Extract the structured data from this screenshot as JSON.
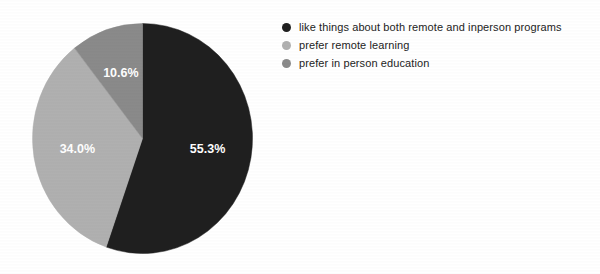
{
  "background_color": "#ffffff",
  "chart_data": {
    "type": "pie",
    "title": "",
    "subtitle": "",
    "xlabel": "",
    "ylabel": "",
    "grid": false,
    "legend_position": "right",
    "start_angle_deg": 0,
    "direction": "clockwise",
    "labels": [
      "like things about both remote and inperson programs",
      "prefer remote learning",
      "prefer in person education"
    ],
    "values": [
      55.3,
      34.0,
      10.6
    ],
    "value_labels": [
      "55.3%",
      "34.0%",
      "10.6%"
    ],
    "colors": [
      "#1f1f1f",
      "#b0b0b0",
      "#8a8a8a"
    ],
    "label_text_color": "#ffffff",
    "slices": [
      {
        "label": "like things about both remote and inperson programs",
        "value": 55.3,
        "display": "55.3%",
        "color": "#1f1f1f",
        "sweep_deg": 199.08
      },
      {
        "label": "prefer remote learning",
        "value": 34.0,
        "display": "34.0%",
        "color": "#b0b0b0",
        "sweep_deg": 122.4
      },
      {
        "label": "prefer in person education",
        "value": 10.6,
        "display": "10.6%",
        "color": "#8a8a8a",
        "sweep_deg": 38.16
      }
    ]
  },
  "legend": {
    "items": [
      {
        "label": "like things about both remote and inperson programs",
        "color": "#1f1f1f",
        "marker": "circle-marker-dark"
      },
      {
        "label": "prefer remote learning",
        "color": "#b0b0b0",
        "marker": "circle-marker-light-gray"
      },
      {
        "label": "prefer in person education",
        "color": "#8a8a8a",
        "marker": "circle-marker-medium-gray"
      }
    ]
  }
}
